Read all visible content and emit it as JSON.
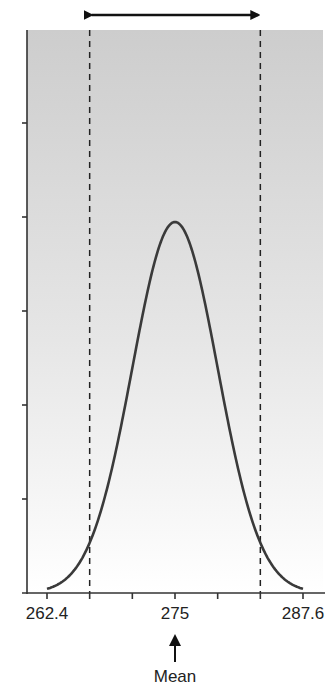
{
  "chart_data": {
    "type": "line",
    "title": "",
    "xlabel": "",
    "ylabel": "",
    "distribution": "normal",
    "mean": 275,
    "sd": 4.2,
    "x_ticks": [
      262.4,
      266.6,
      270.8,
      275,
      279.2,
      283.4,
      287.6
    ],
    "x_tick_labels": [
      "262.4",
      "",
      "",
      "275",
      "",
      "",
      "287.6"
    ],
    "xlim": [
      260.9,
      290.3
    ],
    "y_tick_count": 5,
    "y_tick_labels": [],
    "grid": false,
    "legend": null,
    "reference_lines": [
      {
        "type": "dashed-vertical",
        "x": 266.6,
        "meaning": "mean - 2 SD"
      },
      {
        "type": "dashed-vertical",
        "x": 283.4,
        "meaning": "mean + 2 SD"
      }
    ],
    "annotations": [
      {
        "type": "double-arrow",
        "from": 266.6,
        "to": 283.4,
        "position": "above plot"
      },
      {
        "type": "up-arrow",
        "x": 275,
        "text": "Mean"
      }
    ],
    "background": "gray gradient, dark at top fading to white at bottom"
  },
  "labels": {
    "tick_left": "262.4",
    "tick_mid": "275",
    "tick_right": "287.6",
    "mean_label": "Mean"
  },
  "colors": {
    "curve": "#3a3a3a",
    "axis": "#333333",
    "gradient_top": "#cfcfcf",
    "gradient_bottom": "#ffffff"
  }
}
